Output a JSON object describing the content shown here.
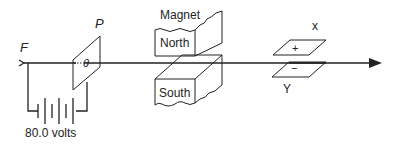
{
  "figure": {
    "type": "apparatus-diagram"
  },
  "labels": {
    "filament": "F",
    "plate": "P",
    "plate_hole": "θ",
    "magnet": "Magnet",
    "north": "North",
    "south": "South",
    "plate_x": "x",
    "plate_y": "Y",
    "plus": "+",
    "minus": "−",
    "battery": "80.0 volts"
  },
  "colors": {
    "line": "#222222",
    "background": "#ffffff"
  }
}
